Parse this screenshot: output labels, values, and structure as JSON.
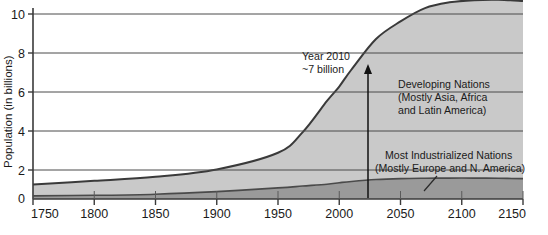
{
  "chart_data": {
    "type": "area",
    "title": "",
    "subtitle": "",
    "xlabel": "",
    "ylabel": "Population (in billions)",
    "xlim": [
      1750,
      2150
    ],
    "ylim": [
      0,
      10.8
    ],
    "grid": true,
    "legend_position": "inline-annotations",
    "stacked": true,
    "x_ticks": [
      "1750",
      "1800",
      "1850",
      "1900",
      "1950",
      "2000",
      "2050",
      "2100",
      "2150"
    ],
    "x_tick_values": [
      1750,
      1800,
      1850,
      1900,
      1950,
      2000,
      2050,
      2100,
      2150
    ],
    "y_ticks": [
      "0",
      "2",
      "4",
      "6",
      "8",
      "10"
    ],
    "y_tick_values": [
      0,
      2,
      4,
      6,
      8,
      10
    ],
    "x": [
      1750,
      1800,
      1850,
      1900,
      1950,
      1970,
      1990,
      2000,
      2010,
      2030,
      2050,
      2070,
      2090,
      2110,
      2130,
      2150
    ],
    "series": [
      {
        "name": "Most Industrialized Nations",
        "sublabel": "(Mostly Europe and N. America)",
        "color": "#9a9a9a",
        "values": [
          0.17,
          0.2,
          0.26,
          0.4,
          0.6,
          0.7,
          0.8,
          0.88,
          0.95,
          1.05,
          1.1,
          1.12,
          1.13,
          1.13,
          1.12,
          1.1
        ]
      },
      {
        "name": "Developing Nations",
        "sublabel": "(Mostly Asia, Africa and Latin America)",
        "color": "#c9c9c9",
        "values": [
          0.62,
          0.78,
          0.94,
          1.2,
          1.9,
          2.9,
          4.5,
          5.2,
          6.05,
          7.6,
          8.5,
          9.2,
          9.5,
          9.62,
          9.65,
          9.6
        ]
      }
    ],
    "totals": [
      0.79,
      0.98,
      1.2,
      1.6,
      2.5,
      3.6,
      5.3,
      6.08,
      7.0,
      8.65,
      9.6,
      10.32,
      10.63,
      10.75,
      10.77,
      10.7
    ],
    "annotations": [
      {
        "name": "year-2010-callout",
        "line1": "Year 2010",
        "line2": "~7 billion",
        "x_value": 2010,
        "y_value": 7,
        "arrow": true
      },
      {
        "name": "developing-nations-label",
        "line1": "Developing Nations",
        "line2": "(Mostly Asia, Africa",
        "line3": "and Latin America)"
      },
      {
        "name": "industrialized-nations-label",
        "line1": "Most Industrialized Nations",
        "line2": "(Mostly Europe and N. America)",
        "leader": true
      }
    ],
    "colors": {
      "developing": "#c9c9c9",
      "industrialized": "#9a9a9a",
      "axis": "#3a3a3a",
      "grid": "#4a4a4a",
      "text": "#1a1a1a",
      "background": "#ffffff"
    }
  }
}
